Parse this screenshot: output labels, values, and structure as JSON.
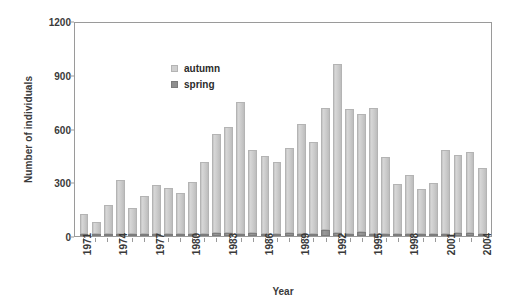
{
  "chart_data": {
    "type": "bar",
    "stacked": true,
    "title": "",
    "xlabel": "Year",
    "ylabel": "Number of individuals",
    "ylim": [
      0,
      1200
    ],
    "yticks": [
      0,
      300,
      600,
      900,
      1200
    ],
    "grid": false,
    "legend_position": "top-left",
    "categories": [
      "1971",
      "1972",
      "1973",
      "1974",
      "1975",
      "1976",
      "1977",
      "1978",
      "1979",
      "1980",
      "1981",
      "1982",
      "1983",
      "1984",
      "1985",
      "1986",
      "1987",
      "1988",
      "1989",
      "1990",
      "1991",
      "1992",
      "1993",
      "1994",
      "1995",
      "1996",
      "1997",
      "1998",
      "1999",
      "2000",
      "2001",
      "2002",
      "2003",
      "2004"
    ],
    "tick_labels": [
      "1971",
      "",
      "",
      "1974",
      "",
      "",
      "1977",
      "",
      "",
      "1980",
      "",
      "",
      "1983",
      "",
      "",
      "1986",
      "",
      "",
      "1989",
      "",
      "",
      "1992",
      "",
      "",
      "1995",
      "",
      "",
      "1998",
      "",
      "",
      "2001",
      "",
      "",
      "2004"
    ],
    "series": [
      {
        "name": "spring",
        "color": "#8f8f8f",
        "values": [
          10,
          6,
          12,
          14,
          10,
          12,
          14,
          12,
          10,
          14,
          12,
          16,
          18,
          14,
          16,
          14,
          12,
          16,
          14,
          14,
          36,
          16,
          14,
          22,
          10,
          14,
          12,
          10,
          8,
          10,
          14,
          16,
          18,
          12
        ]
      },
      {
        "name": "autumn",
        "color": "#cfcfcf",
        "values": [
          110,
          69,
          163,
          296,
          145,
          213,
          271,
          258,
          230,
          287,
          402,
          552,
          590,
          734,
          466,
          434,
          400,
          474,
          612,
          510,
          676,
          944,
          696,
          658,
          706,
          426,
          276,
          330,
          254,
          284,
          466,
          436,
          452,
          368
        ]
      }
    ],
    "totals": [
      120,
      75,
      175,
      310,
      155,
      225,
      285,
      270,
      240,
      301,
      414,
      568,
      608,
      748,
      482,
      448,
      412,
      490,
      626,
      524,
      712,
      960,
      710,
      680,
      716,
      440,
      288,
      340,
      262,
      294,
      480,
      452,
      470,
      380
    ]
  },
  "legend": {
    "items": [
      {
        "label": "autumn",
        "key": "autumn"
      },
      {
        "label": "spring",
        "key": "spring"
      }
    ]
  }
}
